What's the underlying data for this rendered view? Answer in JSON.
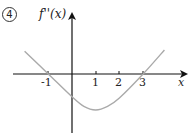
{
  "problem_number": "4",
  "chart_data": {
    "type": "line",
    "title": "",
    "ylabel": "f''(x)",
    "xlabel": "x",
    "x_tick_labels": [
      "-1",
      "1",
      "2",
      "3"
    ],
    "x_ticks": [
      -1,
      1,
      2,
      3
    ],
    "grid": false,
    "legend": null,
    "xlim": [
      -2.5,
      4.8
    ],
    "ylim": [
      -2.5,
      2.7
    ],
    "series": [
      {
        "name": "f''(x)",
        "color": "#aaaaaa",
        "description": "Piecewise-like V curve: decreasing, crosses zero at x=-1, passes y-axis near -1, minimum near (1, -1.5), crosses zero at x=3, then increasing",
        "x": [
          -2,
          -1,
          0,
          0.5,
          1,
          1.5,
          2,
          3,
          3.9
        ],
        "y": [
          0.95,
          0,
          -0.95,
          -1.35,
          -1.5,
          -1.35,
          -1.0,
          0,
          1.0
        ]
      }
    ],
    "colors": {
      "axes": "#111111",
      "curve": "#aaaaaa"
    }
  },
  "labels": {
    "ylabel": "f''(x)",
    "xlabel": "x",
    "ticks": [
      "-1",
      "1",
      "2",
      "3"
    ]
  }
}
